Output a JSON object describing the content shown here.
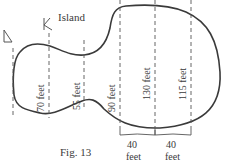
{
  "diagram": {
    "title": "Island",
    "caption": "Fig. 13",
    "measurements": [
      {
        "label": "70 feet"
      },
      {
        "label": "55 feet"
      },
      {
        "label": "90 feet"
      },
      {
        "label": "130 feet"
      },
      {
        "label": "115 feet"
      }
    ],
    "spacings": [
      {
        "value": "40",
        "unit": "feet"
      },
      {
        "value": "40",
        "unit": "feet"
      }
    ],
    "annotations": [
      "L",
      "K"
    ]
  }
}
